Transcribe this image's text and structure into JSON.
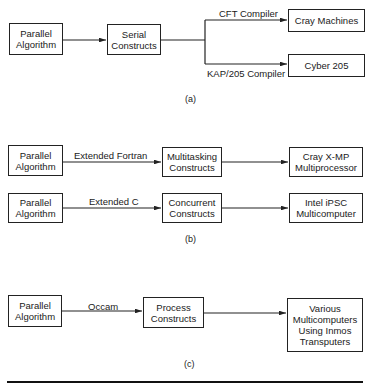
{
  "figure": {
    "panel_a": {
      "caption": "(a)",
      "source": [
        "Parallel",
        "Algorithm"
      ],
      "middle": [
        "Serial",
        "Constructs"
      ],
      "branch_top_label": "CFT Compiler",
      "branch_bottom_label": "KAP/205 Compiler",
      "target_top": [
        "Cray Machines"
      ],
      "target_bottom": [
        "Cyber 205"
      ]
    },
    "panel_b": {
      "caption": "(b)",
      "row1": {
        "source": [
          "Parallel",
          "Algorithm"
        ],
        "edge_label": "Extended Fortran",
        "middle": [
          "Multitasking",
          "Constructs"
        ],
        "target": [
          "Cray X-MP",
          "Multiprocessor"
        ]
      },
      "row2": {
        "source": [
          "Parallel",
          "Algorithm"
        ],
        "edge_label": "Extended C",
        "middle": [
          "Concurrent",
          "Constructs"
        ],
        "target": [
          "Intel iPSC",
          "Multicomputer"
        ]
      }
    },
    "panel_c": {
      "caption": "(c)",
      "source": [
        "Parallel",
        "Algorithm"
      ],
      "edge_label": "Occam",
      "middle": [
        "Process",
        "Constructs"
      ],
      "target": [
        "Various",
        "Multicomputers",
        "Using Inmos",
        "Transputers"
      ]
    }
  }
}
